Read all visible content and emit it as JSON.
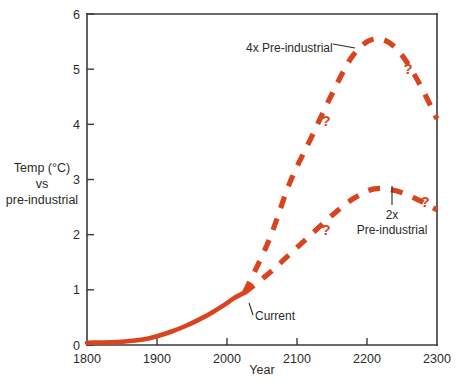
{
  "chart_data": {
    "type": "line",
    "title": "",
    "xlabel": "Year",
    "ylabel": "Temp (°C) vs pre-industrial",
    "ylabel_lines": [
      "Temp (°C)",
      "vs",
      "pre-industrial"
    ],
    "xlim": [
      1800,
      2300
    ],
    "ylim": [
      0,
      6
    ],
    "xticks": [
      1800,
      1900,
      2000,
      2100,
      2200,
      2300
    ],
    "xtick_labels": [
      "1800",
      "1900",
      "2000",
      "2100",
      "2200",
      "2300"
    ],
    "yticks": [
      0,
      1,
      2,
      3,
      4,
      5,
      6
    ],
    "ytick_labels": [
      "0",
      "1",
      "2",
      "3",
      "4",
      "5",
      "6"
    ],
    "grid": false,
    "legend": "none",
    "accent_color": "#D9441F",
    "axis_color": "#3a3a3a",
    "text_color": "#2b2b2b",
    "series": [
      {
        "name": "Observed (historical)",
        "style": "solid",
        "color": "#D9441F",
        "x": [
          1800,
          1850,
          1880,
          1900,
          1920,
          1940,
          1960,
          1980,
          2000,
          2010,
          2025
        ],
        "values": [
          0.04,
          0.06,
          0.1,
          0.16,
          0.24,
          0.34,
          0.46,
          0.6,
          0.76,
          0.85,
          0.95
        ]
      },
      {
        "name": "4x Pre-industrial",
        "style": "dashed",
        "color": "#D9441F",
        "x": [
          2025,
          2060,
          2090,
          2120,
          2150,
          2180,
          2210,
          2240,
          2270,
          2300
        ],
        "values": [
          0.95,
          1.9,
          2.95,
          3.75,
          4.55,
          5.25,
          5.55,
          5.4,
          4.85,
          4.1
        ]
      },
      {
        "name": "2x Pre-industrial",
        "style": "dashed",
        "color": "#D9441F",
        "x": [
          2025,
          2060,
          2090,
          2120,
          2150,
          2180,
          2210,
          2240,
          2270,
          2300
        ],
        "values": [
          0.95,
          1.3,
          1.65,
          2.0,
          2.35,
          2.65,
          2.83,
          2.8,
          2.65,
          2.45
        ]
      }
    ],
    "annotations": [
      {
        "name": "label-4x-pre-industrial",
        "text": "4x Pre-industrial",
        "text_x": 246,
        "text_y": 52,
        "anchor": "start",
        "leader": [
          [
            355,
            48
          ],
          [
            333,
            44
          ]
        ]
      },
      {
        "name": "label-2x-pre-industrial",
        "text_lines": [
          "2x",
          "Pre-industrial"
        ],
        "text_x": 392,
        "text_y": 219,
        "anchor": "middle",
        "leader": [
          [
            392,
            186
          ],
          [
            392,
            205
          ]
        ]
      },
      {
        "name": "label-current",
        "text": "Current",
        "text_x": 255,
        "text_y": 320,
        "anchor": "start",
        "leader": [
          [
            249,
            303
          ],
          [
            253,
            315
          ]
        ]
      }
    ],
    "question_marks": [
      {
        "name": "question-mark-4x-rising",
        "text": "?",
        "x": 326,
        "y": 126
      },
      {
        "name": "question-mark-4x-falling",
        "text": "?",
        "x": 408,
        "y": 74
      },
      {
        "name": "question-mark-2x-rising",
        "text": "?",
        "x": 326,
        "y": 235
      },
      {
        "name": "question-mark-2x-falling",
        "text": "?",
        "x": 425,
        "y": 207
      }
    ]
  }
}
